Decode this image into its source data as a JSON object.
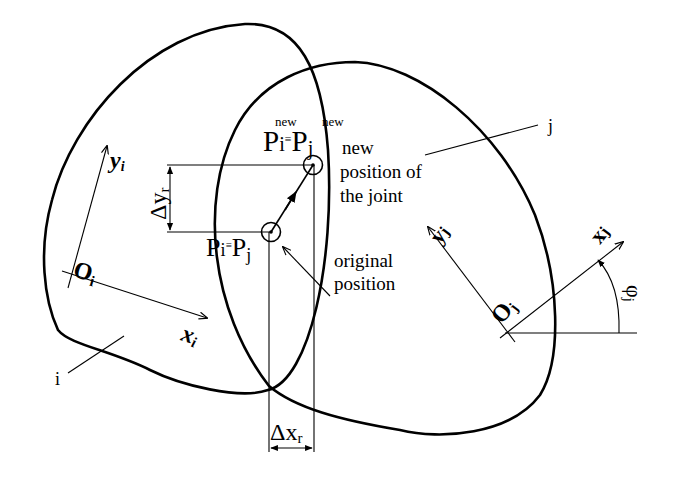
{
  "diagram": {
    "bodies": [
      {
        "id": "i",
        "label": "i"
      },
      {
        "id": "j",
        "label": "j"
      }
    ],
    "frames": {
      "i": {
        "origin": "O",
        "origin_sub": "i",
        "x_axis": "x",
        "x_sub": "i",
        "y_axis": "y",
        "y_sub": "i"
      },
      "j": {
        "origin": "O",
        "origin_sub": "j",
        "x_axis": "x",
        "x_sub": "j",
        "y_axis": "y",
        "y_sub": "j",
        "angle": "φ",
        "angle_sub": "j"
      }
    },
    "joint_new": {
      "p": "P",
      "sub_i": "i",
      "sub_j": "j",
      "equiv": "≡",
      "sup": "new"
    },
    "joint_original": {
      "p": "P",
      "sub_i": "i",
      "sub_j": "j",
      "equiv": "≡"
    },
    "annotations": {
      "new_line1": "new",
      "new_line2": "position of",
      "new_line3": "the joint",
      "orig_line1": "original",
      "orig_line2": "position"
    },
    "dimensions": {
      "dy": {
        "delta": "Δ",
        "var": "y",
        "sub": "r"
      },
      "dx": {
        "delta": "Δ",
        "var": "x",
        "sub": "r"
      }
    }
  }
}
